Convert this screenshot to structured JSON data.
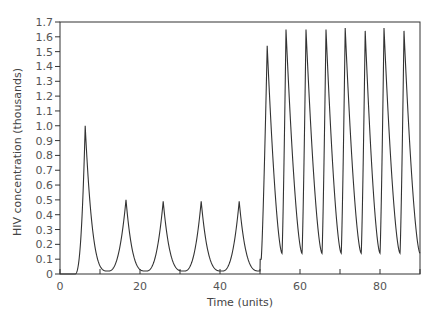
{
  "chart_data": {
    "type": "line",
    "title": "",
    "xlabel": "Time (units)",
    "ylabel": "HIV concentration (thousands)",
    "xlim": [
      0,
      90
    ],
    "ylim": [
      0,
      1.7
    ],
    "x_ticks": [
      0,
      10,
      20,
      30,
      40,
      50,
      60,
      70,
      80,
      90
    ],
    "x_tick_labels": [
      "0",
      "",
      "20",
      "",
      "40",
      "",
      "60",
      "",
      "80",
      ""
    ],
    "y_ticks": [
      0,
      0.1,
      0.2,
      0.3,
      0.4,
      0.5,
      0.6,
      0.7,
      0.8,
      0.9,
      1.0,
      1.1,
      1.2,
      1.3,
      1.4,
      1.5,
      1.6,
      1.7
    ],
    "y_tick_labels": [
      "0",
      "0.1",
      "0.2",
      "0.3",
      "0.4",
      "0.5",
      "0.6",
      "0.7",
      "0.8",
      "0.9",
      "1.0",
      "1.1",
      "1.2",
      "1.3",
      "1.4",
      "1.5",
      "1.6",
      "1.7"
    ],
    "grid": false,
    "legend": null,
    "series": [
      {
        "name": "HIV concentration",
        "peaks": [
          {
            "t": 6.3,
            "value": 1.0
          },
          {
            "t": 16.5,
            "value": 0.5
          },
          {
            "t": 25.8,
            "value": 0.49
          },
          {
            "t": 35.3,
            "value": 0.49
          },
          {
            "t": 44.8,
            "value": 0.49
          },
          {
            "t": 51.8,
            "value": 1.54
          },
          {
            "t": 56.5,
            "value": 1.65
          },
          {
            "t": 61.5,
            "value": 1.65
          },
          {
            "t": 66.5,
            "value": 1.65
          },
          {
            "t": 71.3,
            "value": 1.66
          },
          {
            "t": 76.3,
            "value": 1.64
          },
          {
            "t": 81.0,
            "value": 1.66
          },
          {
            "t": 86.0,
            "value": 1.64
          }
        ],
        "troughs": [
          {
            "t": 12.0,
            "value": 0.02
          },
          {
            "t": 21.5,
            "value": 0.02
          },
          {
            "t": 31.0,
            "value": 0.02
          },
          {
            "t": 40.5,
            "value": 0.02
          },
          {
            "t": 50.0,
            "value": 0.02
          },
          {
            "t": 55.5,
            "value": 0.14
          },
          {
            "t": 60.5,
            "value": 0.14
          },
          {
            "t": 65.5,
            "value": 0.14
          },
          {
            "t": 70.3,
            "value": 0.14
          },
          {
            "t": 75.3,
            "value": 0.14
          },
          {
            "t": 80.0,
            "value": 0.14
          },
          {
            "t": 85.0,
            "value": 0.14
          },
          {
            "t": 90.0,
            "value": 0.14
          }
        ],
        "notes": "Zero until t≈3.7; first peak 1.0 at t≈6.3; damped/steady oscillations of ~0.49 amplitude period ~9.5 until t=50; at t=50 a step to ~0.1 then sustained large oscillations ~1.65 with period ~5 and troughs ~0.14."
      }
    ]
  }
}
